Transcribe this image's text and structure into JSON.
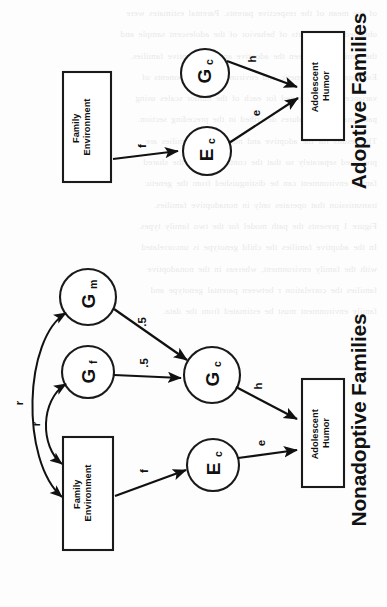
{
  "figure": {
    "orientation": "rotated-90-ccw",
    "background_color": "#fdfdfd",
    "ink_color": "#111111"
  },
  "panels": [
    {
      "id": "adoptive",
      "title": "Adoptive Families",
      "nodes": {
        "family_environment": {
          "line1": "Family",
          "line2": "Environment",
          "shape": "box"
        },
        "gc": {
          "letter": "G",
          "subscript": "c",
          "shape": "circle"
        },
        "ec": {
          "letter": "E",
          "subscript": "c",
          "shape": "circle"
        },
        "outcome": {
          "line1": "Adolescent",
          "line2": "Humor",
          "shape": "box"
        }
      },
      "paths": [
        {
          "from": "family_environment",
          "to": "ec",
          "label": "f",
          "type": "single-arrow"
        },
        {
          "from": "gc",
          "to": "outcome",
          "label": "h",
          "type": "single-arrow"
        },
        {
          "from": "ec",
          "to": "outcome",
          "label": "e",
          "type": "single-arrow"
        }
      ]
    },
    {
      "id": "nonadoptive",
      "title": "Nonadoptive Families",
      "nodes": {
        "gm": {
          "letter": "G",
          "subscript": "m",
          "shape": "circle"
        },
        "gf": {
          "letter": "G",
          "subscript": "f",
          "shape": "circle"
        },
        "family_environment": {
          "line1": "Family",
          "line2": "Environment",
          "shape": "box"
        },
        "gc": {
          "letter": "G",
          "subscript": "c",
          "shape": "circle"
        },
        "ec": {
          "letter": "E",
          "subscript": "c",
          "shape": "circle"
        },
        "outcome": {
          "line1": "Adolescent",
          "line2": "Humor",
          "shape": "box"
        }
      },
      "paths": [
        {
          "from": "gm",
          "to": "gc",
          "label": ".5",
          "type": "single-arrow"
        },
        {
          "from": "gf",
          "to": "gc",
          "label": ".5",
          "type": "single-arrow"
        },
        {
          "from": "family_environment",
          "to": "gm",
          "label": "r",
          "type": "double-arrow-curve"
        },
        {
          "from": "family_environment",
          "to": "gf",
          "label": "r",
          "type": "double-arrow-curve"
        },
        {
          "from": "family_environment",
          "to": "ec",
          "label": "f",
          "type": "single-arrow"
        },
        {
          "from": "gc",
          "to": "outcome",
          "label": "h",
          "type": "single-arrow"
        },
        {
          "from": "ec",
          "to": "outcome",
          "label": "e",
          "type": "single-arrow"
        }
      ]
    }
  ],
  "ghost_text": {
    "lines": [
      "of the mean of the respective parents. Parental estimates were",
      "obtained from reports of behavior of the adolescent sample and",
      "the similarity between the adoptive and nonadoptive families.",
      "Estimates of the genetic and environmental components of",
      "variance were computed for each of the humor scales using",
      "path analytic procedures described in the preceding section.",
      "The results for the adoptive and nonadoptive families are",
      "presented separately so that the contribution of the shared",
      "family environment can be distinguished from the genetic",
      "transmission that operates only in nonadoptive families.",
      "Figure 1 presents the path model for the two family types.",
      "In the adoptive families the child genotype is uncorrelated",
      "with the family environment, whereas in the nonadoptive",
      "families the correlation r between parental genotype and",
      "family environment must be estimated from the data."
    ]
  }
}
